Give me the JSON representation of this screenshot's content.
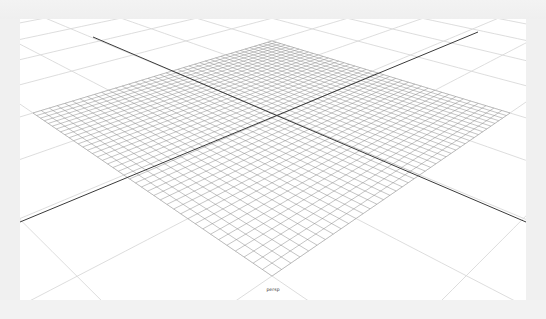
{
  "viewport": {
    "camera_label": "persp",
    "background": "#ffffff",
    "frame_color": "#f0f0f0"
  },
  "grid": {
    "dense_plane": {
      "corners": {
        "top": [
          252,
          22
        ],
        "right": [
          490,
          94
        ],
        "bottom": [
          252,
          257
        ],
        "left": [
          13,
          94
        ]
      },
      "divisions": 40,
      "line_color": "#8a8a8a"
    },
    "coarse_grid": {
      "line_color": "#d4d4d4",
      "extent_multiplier": 3,
      "divisions_per_side": 4
    },
    "axes": {
      "color": "#3a3a3a",
      "lines": [
        {
          "name": "x-axis",
          "from": [
            73,
            18
          ],
          "to": [
            506,
            203
          ]
        },
        {
          "name": "z-axis",
          "from": [
            0,
            203
          ],
          "to": [
            458,
            13
          ]
        }
      ]
    }
  }
}
